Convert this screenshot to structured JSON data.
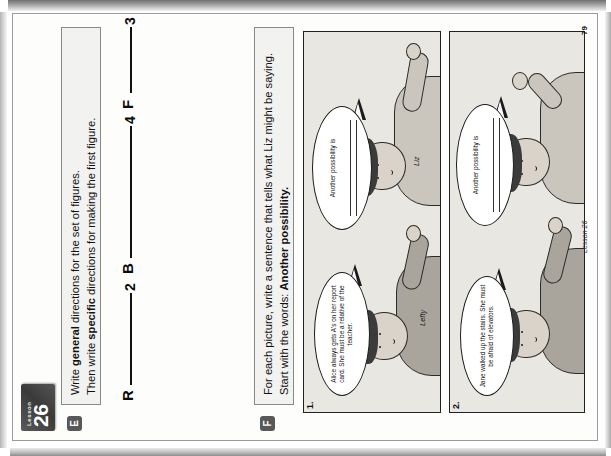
{
  "document": {
    "lesson_word": "Lesson",
    "lesson_number": "26",
    "page_number": "79",
    "footer_label": "Lesson 26"
  },
  "sections": {
    "e": {
      "letter": "E",
      "instruction_line1_pre": "Write ",
      "instruction_line1_bold": "general",
      "instruction_line1_post": " directions for the set of figures.",
      "instruction_line2_pre": "Then write ",
      "instruction_line2_bold": "specific",
      "instruction_line2_post": " directions for making the first figure.",
      "figures": [
        {
          "letter": "R",
          "number": "2"
        },
        {
          "letter": "B",
          "number": "4"
        },
        {
          "letter": "F",
          "number": "3"
        }
      ]
    },
    "f": {
      "letter": "F",
      "instruction_line1": "For each picture, write a sentence that tells what Liz might be saying.",
      "instruction_line2_pre": "Start with the words: ",
      "instruction_line2_bold": "Another possibility.",
      "panels": [
        {
          "number": "1.",
          "speaker_bubble": "Alice always gets A's on her report card. She must be a relative of the teacher.",
          "response_bubble": "Another possibility is",
          "left_character": "Lefty",
          "right_character": "Liz"
        },
        {
          "number": "2.",
          "speaker_bubble": "Jane walked up the stairs. She must be afraid of elevators.",
          "response_bubble": "Another possibility is",
          "left_character": "",
          "right_character": ""
        }
      ]
    }
  },
  "colors": {
    "paper": "#fdfdfc",
    "instruction_box_fill": "#f2f2f0",
    "badge_dark": "#3a3a3a",
    "panel_fill": "#e9e7e2",
    "ink": "#111111"
  }
}
